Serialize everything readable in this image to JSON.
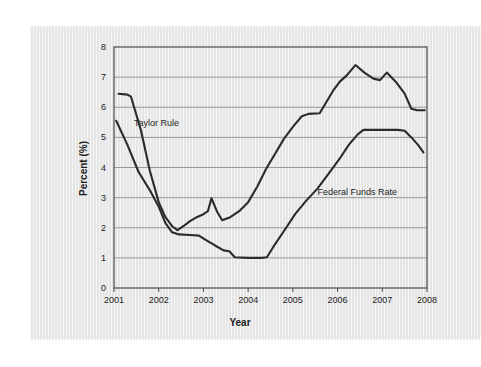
{
  "figure": {
    "background_color": "#ffffff",
    "panel_color": "#e8e8e8",
    "line_color": "#2b2b2b",
    "grid_color": "#8e8e8e",
    "axis_color": "#4a4a4a"
  },
  "chart_data": {
    "type": "line",
    "title": "",
    "xlabel": "Year",
    "ylabel": "Percent (%)",
    "xlim": [
      2001,
      2008
    ],
    "ylim": [
      0,
      8
    ],
    "yticks": [
      0,
      1,
      2,
      3,
      4,
      5,
      6,
      7,
      8
    ],
    "ytick_labels": [
      "0",
      "1",
      "2",
      "3",
      "4",
      "5",
      "6",
      "7",
      "8"
    ],
    "xticks": [
      2001,
      2002,
      2003,
      2004,
      2005,
      2006,
      2007,
      2008
    ],
    "xtick_labels": [
      "2001",
      "2002",
      "2003",
      "2004",
      "2005",
      "2006",
      "2007",
      "2008"
    ],
    "grid": "horizontal",
    "legend_position": "inline-annotations",
    "series": [
      {
        "name": "Taylor Rule",
        "label_x": 2001.45,
        "label_y": 5.45,
        "points": [
          [
            2001.1,
            6.45
          ],
          [
            2001.3,
            6.42
          ],
          [
            2001.38,
            6.35
          ],
          [
            2001.6,
            5.25
          ],
          [
            2001.8,
            3.9
          ],
          [
            2002.0,
            2.85
          ],
          [
            2002.15,
            2.35
          ],
          [
            2002.3,
            2.05
          ],
          [
            2002.42,
            1.92
          ],
          [
            2002.55,
            2.05
          ],
          [
            2002.7,
            2.22
          ],
          [
            2002.85,
            2.35
          ],
          [
            2003.0,
            2.45
          ],
          [
            2003.1,
            2.55
          ],
          [
            2003.18,
            2.98
          ],
          [
            2003.3,
            2.55
          ],
          [
            2003.42,
            2.25
          ],
          [
            2003.6,
            2.35
          ],
          [
            2003.8,
            2.55
          ],
          [
            2004.0,
            2.85
          ],
          [
            2004.2,
            3.35
          ],
          [
            2004.4,
            3.95
          ],
          [
            2004.6,
            4.45
          ],
          [
            2004.8,
            4.95
          ],
          [
            2005.0,
            5.35
          ],
          [
            2005.2,
            5.7
          ],
          [
            2005.35,
            5.78
          ],
          [
            2005.6,
            5.8
          ],
          [
            2005.72,
            6.1
          ],
          [
            2005.9,
            6.55
          ],
          [
            2006.05,
            6.85
          ],
          [
            2006.2,
            7.05
          ],
          [
            2006.4,
            7.4
          ],
          [
            2006.6,
            7.15
          ],
          [
            2006.8,
            6.95
          ],
          [
            2006.95,
            6.9
          ],
          [
            2007.1,
            7.15
          ],
          [
            2007.3,
            6.85
          ],
          [
            2007.5,
            6.45
          ],
          [
            2007.65,
            5.95
          ],
          [
            2007.78,
            5.9
          ],
          [
            2007.95,
            5.9
          ]
        ]
      },
      {
        "name": "Federal Funds Rate",
        "label_x": 2005.55,
        "label_y": 3.15,
        "points": [
          [
            2001.05,
            5.55
          ],
          [
            2001.3,
            4.75
          ],
          [
            2001.55,
            3.85
          ],
          [
            2001.8,
            3.25
          ],
          [
            2002.0,
            2.7
          ],
          [
            2002.15,
            2.15
          ],
          [
            2002.3,
            1.85
          ],
          [
            2002.45,
            1.78
          ],
          [
            2002.7,
            1.76
          ],
          [
            2002.9,
            1.74
          ],
          [
            2003.05,
            1.6
          ],
          [
            2003.25,
            1.42
          ],
          [
            2003.45,
            1.25
          ],
          [
            2003.58,
            1.22
          ],
          [
            2003.7,
            1.02
          ],
          [
            2004.0,
            1.0
          ],
          [
            2004.3,
            1.0
          ],
          [
            2004.42,
            1.02
          ],
          [
            2004.6,
            1.45
          ],
          [
            2004.85,
            2.0
          ],
          [
            2005.05,
            2.45
          ],
          [
            2005.3,
            2.9
          ],
          [
            2005.55,
            3.3
          ],
          [
            2005.8,
            3.8
          ],
          [
            2006.05,
            4.3
          ],
          [
            2006.25,
            4.75
          ],
          [
            2006.45,
            5.1
          ],
          [
            2006.58,
            5.25
          ],
          [
            2007.0,
            5.25
          ],
          [
            2007.35,
            5.25
          ],
          [
            2007.5,
            5.22
          ],
          [
            2007.65,
            5.0
          ],
          [
            2007.8,
            4.75
          ],
          [
            2007.92,
            4.5
          ]
        ]
      }
    ]
  }
}
